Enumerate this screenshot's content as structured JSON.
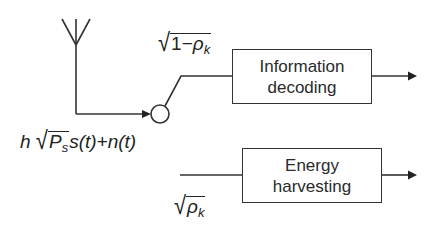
{
  "diagram": {
    "type": "block-diagram",
    "input_signal": {
      "label_parts": {
        "h": "h",
        "P": "P",
        "P_sub": "s",
        "rest": "s(t)+n(t)"
      },
      "full_text": "h√(P_s) s(t) + n(t)"
    },
    "split_upper": {
      "label_parts": {
        "one_minus": "1−",
        "rho": "ρ",
        "sub": "k"
      },
      "full_text": "√(1−ρ_k)"
    },
    "split_lower": {
      "label_parts": {
        "rho": "ρ",
        "sub": "k"
      },
      "full_text": "√(ρ_k)"
    },
    "blocks": [
      {
        "id": "info",
        "line1": "Information",
        "line2": "decoding"
      },
      {
        "id": "energy",
        "line1": "Energy",
        "line2": "harvesting"
      }
    ],
    "colors": {
      "stroke": "#333333",
      "background": "#ffffff",
      "text": "#222222"
    }
  }
}
